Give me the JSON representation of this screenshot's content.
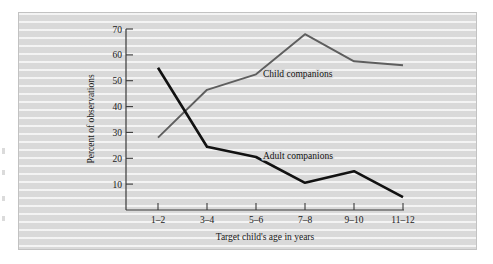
{
  "figure": {
    "background_color": "#d9d9d9",
    "frame_color": "#c2c2c2"
  },
  "chart_data": {
    "type": "line",
    "title": "",
    "subtitle": "",
    "xlabel": "Target child's age in years",
    "ylabel": "Percent of observations",
    "categories": [
      "1–2",
      "3–4",
      "5–6",
      "7–8",
      "9–10",
      "11–12"
    ],
    "ylim": [
      0,
      70
    ],
    "yticks": [
      10,
      20,
      30,
      40,
      50,
      60,
      70
    ],
    "ytick_labels": [
      "10",
      "20",
      "30",
      "40",
      "50",
      "60",
      "70"
    ],
    "grid": false,
    "legend_position": "inline-annotation",
    "series": [
      {
        "name": "Child companions",
        "color": "#5e5e5e",
        "values": [
          28,
          46.5,
          52.5,
          68,
          57.5,
          56
        ]
      },
      {
        "name": "Adult companions",
        "color": "#121212",
        "values": [
          55,
          24.5,
          20.5,
          10.5,
          15,
          5
        ]
      }
    ],
    "annotations": [
      {
        "text": "Child companions",
        "x_category": "5–6",
        "y": 53
      },
      {
        "text": "Adult companions",
        "x_category": "5–6",
        "y": 21
      }
    ]
  }
}
